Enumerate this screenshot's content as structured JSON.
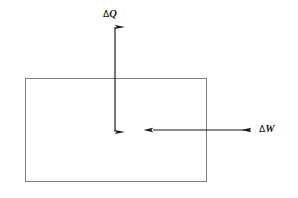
{
  "figure": {
    "type": "thermodynamic-system-diagram",
    "width": 298,
    "height": 198,
    "background_color": "#ffffff"
  },
  "system_boundary": {
    "name": "system-rectangle",
    "shape": "rectangle",
    "x": 25,
    "y": 78,
    "width": 182,
    "height": 104,
    "stroke_color": "#808080",
    "stroke_width": 1,
    "fill_color": "#ffffff"
  },
  "arrows": [
    {
      "id": "heat-arrow",
      "orientation": "vertical",
      "heads": "double",
      "x": 115,
      "y_start": 26,
      "y_end": 133,
      "color": "#1a1a1a",
      "shaft_width": 1.2,
      "direction_note": "crosses top boundary, points into system"
    },
    {
      "id": "work-arrow",
      "orientation": "horizontal",
      "heads": "double",
      "y": 130,
      "x_start": 152,
      "x_end": 252,
      "color": "#1a1a1a",
      "shaft_width": 1.2,
      "direction_note": "crosses right boundary, points out of system"
    }
  ],
  "labels": {
    "heat": {
      "delta": "Δ",
      "symbol": "Q",
      "full": "ΔQ"
    },
    "work": {
      "delta": "Δ",
      "symbol": "W",
      "full": "ΔW"
    }
  }
}
